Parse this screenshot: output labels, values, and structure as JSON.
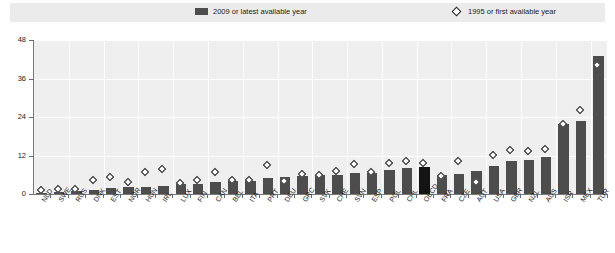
{
  "legend": {
    "bars_label": "2009 or latest available year",
    "markers_label": "1995 or first available year",
    "bar_color": "#4d4d4d",
    "marker_color": "#ffffff",
    "marker_edge_color": "#1f1f1f",
    "highlight_color": "#141414"
  },
  "axis": {
    "y_ticks": [
      0,
      12,
      24,
      36,
      48
    ],
    "y_tick_labels": [
      "0",
      "12",
      "24",
      "36",
      "48"
    ],
    "ymin": 0,
    "ymax": 48
  },
  "chart_data": {
    "type": "bar",
    "title": "",
    "subtitle": "",
    "xlabel": "",
    "ylabel": "",
    "ylim": [
      0,
      48
    ],
    "grid": true,
    "legend_position": "top",
    "highlight_category": "OECD",
    "categories": [
      "NLD",
      "SWE",
      "RUS",
      "DNK",
      "EST",
      "NOR",
      "HUN",
      "IRL",
      "LUX",
      "FIN",
      "CAN",
      "BEL",
      "ITA",
      "PRT",
      "DEU",
      "GRC",
      "SVK",
      "CHE",
      "SVN",
      "ESP",
      "POL",
      "CHL",
      "OECD",
      "FRA",
      "CZE",
      "AUT",
      "USA",
      "GBR",
      "NZL",
      "AUS",
      "ISR",
      "MEX",
      "TUR"
    ],
    "series": [
      {
        "name": "2009 or latest available year",
        "type": "bar",
        "values": [
          0.4,
          0.6,
          1.0,
          1.4,
          2.0,
          2.1,
          2.3,
          2.6,
          3.0,
          3.2,
          3.6,
          4.0,
          4.2,
          5.0,
          5.2,
          5.6,
          5.8,
          6.0,
          6.4,
          6.6,
          7.4,
          8.2,
          8.4,
          6.0,
          6.2,
          7.2,
          8.6,
          10.2,
          10.6,
          11.6,
          21.8,
          22.8,
          43.0
        ]
      },
      {
        "name": "1995 or first available year",
        "type": "scatter",
        "marker": "diamond",
        "values": [
          0.8,
          1.2,
          1.3,
          4.0,
          5.0,
          3.4,
          6.4,
          7.6,
          3.0,
          4.0,
          6.4,
          4.2,
          4.2,
          8.6,
          3.8,
          5.8,
          5.6,
          7.0,
          9.0,
          6.6,
          9.4,
          10.0,
          9.4,
          5.4,
          10.0,
          3.4,
          12.0,
          13.4,
          13.0,
          13.8,
          21.6,
          26.0,
          39.8
        ]
      }
    ]
  }
}
